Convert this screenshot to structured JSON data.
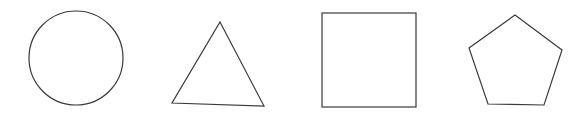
{
  "canvas": {
    "width": 587,
    "height": 118,
    "background": "#ffffff"
  },
  "stroke_color": "#3a3a3a",
  "shapes": [
    {
      "id": "circle",
      "type": "circle",
      "cx": 76,
      "cy": 58,
      "r": 47
    },
    {
      "id": "triangle",
      "type": "polygon",
      "points": [
        [
          220,
          22
        ],
        [
          264,
          106
        ],
        [
          172,
          103
        ]
      ]
    },
    {
      "id": "square",
      "type": "rect",
      "x": 322,
      "y": 13,
      "width": 94,
      "height": 94
    },
    {
      "id": "pentagon",
      "type": "polygon",
      "points": [
        [
          515,
          15
        ],
        [
          562,
          50
        ],
        [
          544,
          105
        ],
        [
          488,
          104
        ],
        [
          469,
          48
        ]
      ]
    }
  ]
}
